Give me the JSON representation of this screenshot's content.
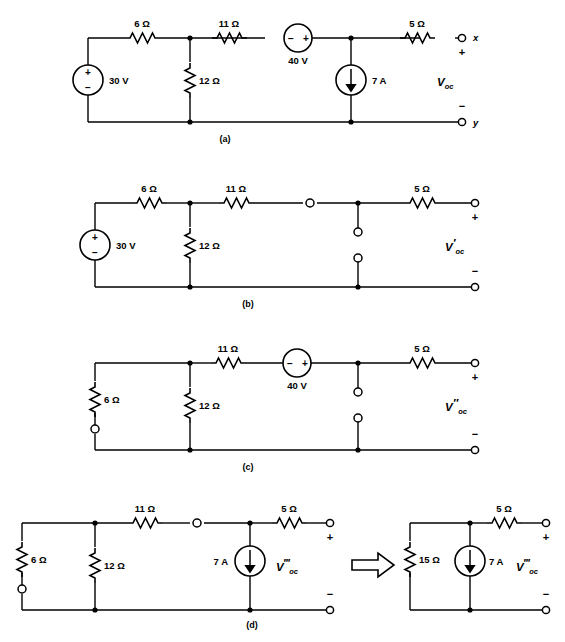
{
  "figure": {
    "panels": [
      {
        "id": "a",
        "caption": "(a)",
        "components": [
          {
            "name": "voltage-source-30v",
            "label": "30 V",
            "type": "voltage-source",
            "polarity_top": "+",
            "polarity_bottom": "−"
          },
          {
            "name": "resistor-6ohm",
            "label": "6 Ω",
            "type": "resistor"
          },
          {
            "name": "resistor-12ohm",
            "label": "12 Ω",
            "type": "resistor"
          },
          {
            "name": "resistor-11ohm",
            "label": "11 Ω",
            "type": "resistor"
          },
          {
            "name": "voltage-source-40v",
            "label": "40 V",
            "type": "voltage-source",
            "polarity_left": "−",
            "polarity_right": "+"
          },
          {
            "name": "current-source-7a",
            "label": "7 A",
            "type": "current-source",
            "direction": "down"
          },
          {
            "name": "resistor-5ohm",
            "label": "5 Ω",
            "type": "resistor"
          }
        ],
        "terminals": {
          "top": "x",
          "bottom": "y",
          "plus": "+",
          "minus": "−"
        },
        "output_label": {
          "symbol": "V",
          "subscript": "oc",
          "prime": ""
        }
      },
      {
        "id": "b",
        "caption": "(b)",
        "components": [
          {
            "name": "voltage-source-30v",
            "label": "30 V",
            "type": "voltage-source",
            "polarity_top": "+",
            "polarity_bottom": "−"
          },
          {
            "name": "resistor-6ohm",
            "label": "6 Ω",
            "type": "resistor"
          },
          {
            "name": "resistor-12ohm",
            "label": "12 Ω",
            "type": "resistor"
          },
          {
            "name": "resistor-11ohm",
            "label": "11 Ω",
            "type": "resistor"
          },
          {
            "name": "resistor-5ohm",
            "label": "5 Ω",
            "type": "resistor"
          }
        ],
        "terminals": {
          "plus": "+",
          "minus": "−"
        },
        "output_label": {
          "symbol": "V",
          "subscript": "oc",
          "prime": "′"
        }
      },
      {
        "id": "c",
        "caption": "(c)",
        "components": [
          {
            "name": "resistor-6ohm",
            "label": "6 Ω",
            "type": "resistor"
          },
          {
            "name": "resistor-12ohm",
            "label": "12 Ω",
            "type": "resistor"
          },
          {
            "name": "resistor-11ohm",
            "label": "11 Ω",
            "type": "resistor"
          },
          {
            "name": "voltage-source-40v",
            "label": "40 V",
            "type": "voltage-source",
            "polarity_left": "−",
            "polarity_right": "+"
          },
          {
            "name": "resistor-5ohm",
            "label": "5 Ω",
            "type": "resistor"
          }
        ],
        "terminals": {
          "plus": "+",
          "minus": "−"
        },
        "output_label": {
          "symbol": "V",
          "subscript": "oc",
          "prime": "″"
        }
      },
      {
        "id": "d",
        "caption": "(d)",
        "arrow": "⇒",
        "left_circuit": {
          "components": [
            {
              "name": "resistor-6ohm",
              "label": "6 Ω",
              "type": "resistor"
            },
            {
              "name": "resistor-12ohm",
              "label": "12 Ω",
              "type": "resistor"
            },
            {
              "name": "resistor-11ohm",
              "label": "11 Ω",
              "type": "resistor"
            },
            {
              "name": "current-source-7a",
              "label": "7 A",
              "type": "current-source",
              "direction": "down"
            },
            {
              "name": "resistor-5ohm",
              "label": "5 Ω",
              "type": "resistor"
            }
          ],
          "terminals": {
            "plus": "+",
            "minus": "−"
          },
          "output_label": {
            "symbol": "V",
            "subscript": "oc",
            "prime": "‴"
          }
        },
        "right_circuit": {
          "components": [
            {
              "name": "resistor-15ohm",
              "label": "15 Ω",
              "type": "resistor"
            },
            {
              "name": "current-source-7a",
              "label": "7 A",
              "type": "current-source",
              "direction": "down"
            },
            {
              "name": "resistor-5ohm",
              "label": "5 Ω",
              "type": "resistor"
            }
          ],
          "terminals": {
            "plus": "+",
            "minus": "−"
          },
          "output_label": {
            "symbol": "V",
            "subscript": "oc",
            "prime": "‴"
          }
        }
      }
    ],
    "colors": {
      "ink": "#000000",
      "background": "#ffffff"
    }
  }
}
